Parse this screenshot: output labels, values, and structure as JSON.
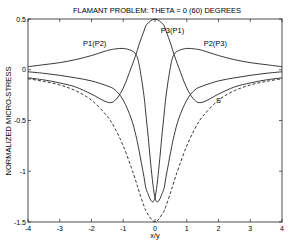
{
  "chart_data": {
    "type": "line",
    "title": "FLAMANT PROBLEM: THETA = 0 (60) DEGREES",
    "xlabel": "x/y",
    "ylabel": "NORMALIZED MICRO-STRESS",
    "xlim": [
      -4,
      4
    ],
    "ylim": [
      -1.5,
      0.5
    ],
    "xticks": [
      -4,
      -3,
      -2,
      -1,
      0,
      1,
      2,
      3,
      4
    ],
    "yticks": [
      0.5,
      0,
      -0.5,
      -1,
      -1.5
    ],
    "ytick_labels": [
      "0.5",
      "0",
      "-0.5",
      "-1",
      "-1.5"
    ],
    "grid": false,
    "legend": "inline annotations",
    "x": [
      -4,
      -3.5,
      -3,
      -2.5,
      -2,
      -1.5,
      -1.25,
      -1,
      -0.75,
      -0.6,
      -0.5,
      -0.35,
      -0.25,
      0,
      0.25,
      0.35,
      0.5,
      0.6,
      0.75,
      1,
      1.25,
      1.5,
      2,
      2.5,
      3,
      3.5,
      4
    ],
    "series": [
      {
        "name": "P1(P2)",
        "style": "solid",
        "values": [
          0.03,
          0.05,
          0.07,
          0.1,
          0.14,
          0.19,
          0.205,
          0.21,
          0.19,
          0.15,
          0.05,
          -0.25,
          -0.55,
          -1.26,
          -1.2,
          -1.05,
          -0.8,
          -0.65,
          -0.48,
          -0.3,
          -0.2,
          -0.16,
          -0.11,
          -0.08,
          -0.055,
          -0.035,
          -0.02
        ]
      },
      {
        "name": "P2(P3)",
        "style": "solid",
        "values": [
          -0.02,
          -0.035,
          -0.055,
          -0.08,
          -0.11,
          -0.16,
          -0.2,
          -0.3,
          -0.48,
          -0.65,
          -0.8,
          -1.05,
          -1.2,
          -1.26,
          -0.55,
          -0.25,
          0.05,
          0.15,
          0.19,
          0.21,
          0.205,
          0.19,
          0.14,
          0.1,
          0.07,
          0.05,
          0.03
        ]
      },
      {
        "name": "P3(P1)",
        "style": "solid",
        "values": [
          -0.08,
          -0.1,
          -0.13,
          -0.17,
          -0.24,
          -0.32,
          -0.3,
          -0.18,
          0.02,
          0.15,
          0.25,
          0.38,
          0.45,
          0.5,
          0.45,
          0.38,
          0.25,
          0.15,
          0.02,
          -0.18,
          -0.3,
          -0.32,
          -0.24,
          -0.17,
          -0.13,
          -0.1,
          -0.08
        ]
      },
      {
        "name": "S",
        "style": "dashed",
        "values": [
          -0.088,
          -0.115,
          -0.15,
          -0.207,
          -0.3,
          -0.46,
          -0.585,
          -0.75,
          -0.96,
          -1.1,
          -1.2,
          -1.34,
          -1.41,
          -1.5,
          -1.41,
          -1.34,
          -1.2,
          -1.1,
          -0.96,
          -0.75,
          -0.585,
          -0.46,
          -0.3,
          -0.207,
          -0.15,
          -0.115,
          -0.088
        ]
      }
    ],
    "annotations": [
      {
        "text": "P1(P2)",
        "x": -1.9,
        "y": 0.23
      },
      {
        "text": "P3(P1)",
        "x": 0.55,
        "y": 0.36
      },
      {
        "text": "P2(P3)",
        "x": 1.9,
        "y": 0.23
      },
      {
        "text": "S",
        "x": 2.0,
        "y": -0.33
      }
    ]
  }
}
